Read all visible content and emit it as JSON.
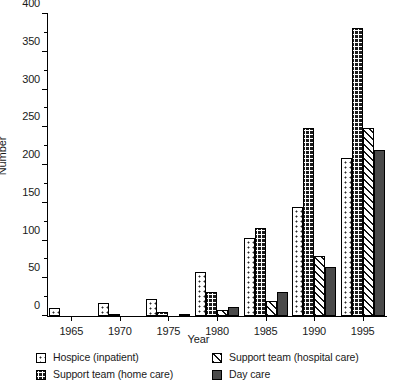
{
  "chart_data": {
    "type": "bar",
    "title": "",
    "xlabel": "Year",
    "ylabel": "Number",
    "ylim": [
      0,
      400
    ],
    "yticks": [
      0,
      50,
      100,
      150,
      200,
      250,
      300,
      350,
      400
    ],
    "ytick_labels": [
      "0",
      "50",
      "100",
      "150",
      "200",
      "250",
      "300",
      "350",
      "400"
    ],
    "minor_yticks": [
      25,
      75,
      125,
      175,
      225,
      275,
      325,
      375
    ],
    "grid": false,
    "legend_position": "bottom",
    "categories": [
      "1965",
      "1970",
      "1975",
      "1980",
      "1985",
      "1990",
      "1995"
    ],
    "series": [
      {
        "name": "Hospice (inpatient)",
        "pattern": "pat-dot",
        "values": [
          10,
          17,
          22,
          58,
          103,
          145,
          209
        ]
      },
      {
        "name": "Support team (home care)",
        "pattern": "pat-grid",
        "values": [
          0,
          3,
          5,
          32,
          117,
          249,
          382
        ]
      },
      {
        "name": "Support team (hospital care)",
        "pattern": "pat-hatch",
        "values": [
          0,
          0,
          0,
          8,
          20,
          80,
          249
        ]
      },
      {
        "name": "Day care",
        "pattern": "pat-solid",
        "values": [
          0,
          0,
          2,
          12,
          32,
          65,
          220
        ]
      }
    ]
  },
  "legend": {
    "entries": [
      {
        "label": "Hospice (inpatient)",
        "pattern": "pat-dot"
      },
      {
        "label": "Support team (hospital care)",
        "pattern": "pat-hatch"
      },
      {
        "label": "Support team (home care)",
        "pattern": "pat-grid"
      },
      {
        "label": "Day care",
        "pattern": "pat-solid"
      }
    ]
  }
}
